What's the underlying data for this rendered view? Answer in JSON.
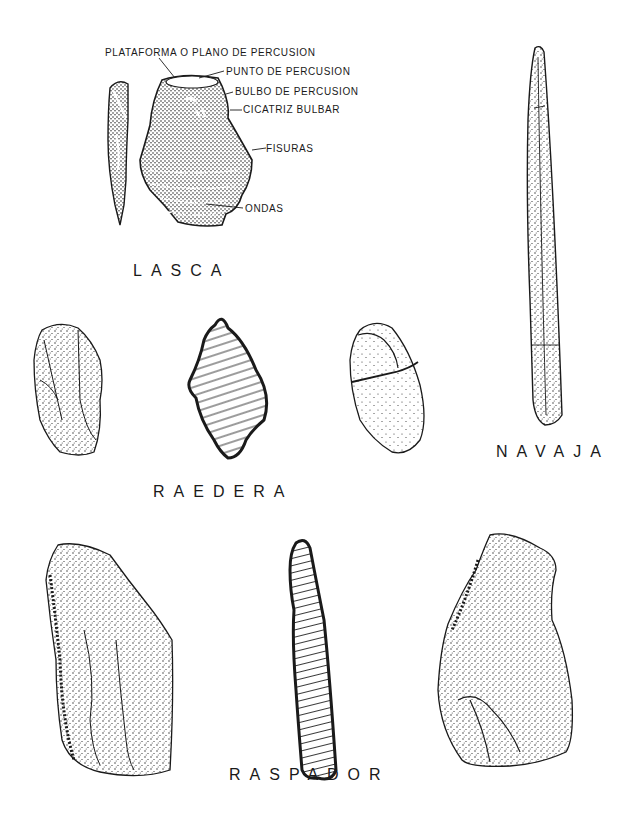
{
  "figure": {
    "sections": {
      "lasca": {
        "title": "LASCA",
        "annotations": [
          "PLATAFORMA O PLANO DE PERCUSION",
          "PUNTO DE PERCUSION",
          "BULBO DE PERCUSION",
          "CICATRIZ BULBAR",
          "FISURAS",
          "ONDAS"
        ]
      },
      "navaja": {
        "title": "NAVAJA"
      },
      "raedera": {
        "title": "RAEDERA"
      },
      "raspador": {
        "title": "RASPADOR"
      }
    },
    "colors": {
      "ink": "#1a1a1a",
      "paper": "#ffffff"
    }
  }
}
